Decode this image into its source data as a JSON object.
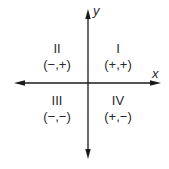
{
  "diagram": {
    "axes": {
      "x_label": "x",
      "y_label": "y"
    },
    "quadrants": [
      {
        "id": "I",
        "numeral": "I",
        "signs": "(+,+)"
      },
      {
        "id": "II",
        "numeral": "II",
        "signs": "(−,+)"
      },
      {
        "id": "III",
        "numeral": "III",
        "signs": "(−,−)"
      },
      {
        "id": "IV",
        "numeral": "IV",
        "signs": "(+,−)"
      }
    ],
    "colors": {
      "axis": "#1a1a1a",
      "text": "#2a2a2a",
      "background": "#ffffff"
    }
  }
}
